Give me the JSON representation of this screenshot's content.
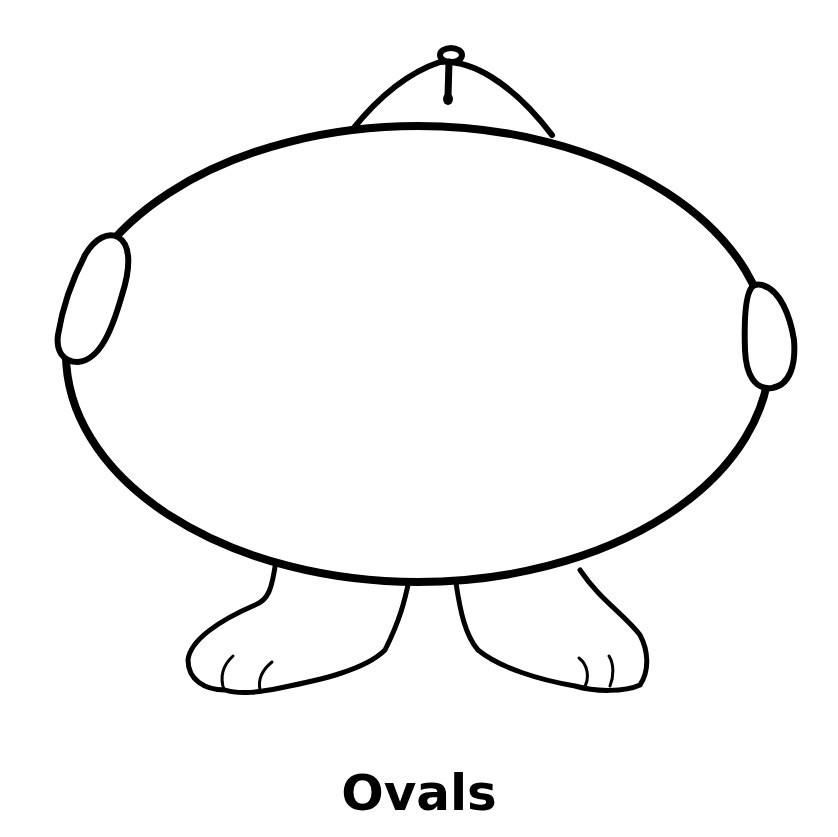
{
  "worksheet": {
    "caption": "Ovals",
    "subject": "oval-shaped creature outline (coloring page)",
    "colors": {
      "ink": "#000000",
      "paper": "#ffffff"
    },
    "parts": [
      {
        "name": "body",
        "shape": "oval"
      },
      {
        "name": "head",
        "shape": "dome with small loop on top"
      },
      {
        "name": "left-hand",
        "shape": "small oval"
      },
      {
        "name": "right-hand",
        "shape": "small oval"
      },
      {
        "name": "left-foot",
        "shape": "foot with toes"
      },
      {
        "name": "right-foot",
        "shape": "foot with toes"
      }
    ]
  }
}
